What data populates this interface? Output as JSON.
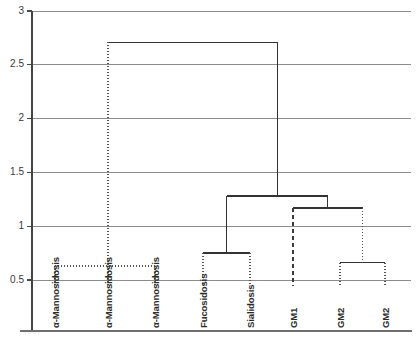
{
  "chart_data": {
    "type": "dendrogram",
    "title": "",
    "xlabel": "",
    "ylabel": "",
    "ylim": [
      0.35,
      3.0
    ],
    "grid": true,
    "legend": null,
    "y_ticks": [
      {
        "value": 3,
        "label": "3"
      },
      {
        "value": 2.5,
        "label": "2.5"
      },
      {
        "value": 2,
        "label": "2"
      },
      {
        "value": 1.5,
        "label": "1.5"
      },
      {
        "value": 1,
        "label": "1"
      },
      {
        "value": 0.5,
        "label": "0.5"
      }
    ],
    "leaves": [
      {
        "index": 0,
        "label": "α-Mannosidosis"
      },
      {
        "index": 1,
        "label": "α-Mannosidosis"
      },
      {
        "index": 2,
        "label": "α-Mannosidosis"
      },
      {
        "index": 3,
        "label": "Fucosidosis"
      },
      {
        "index": 4,
        "label": "Sialidosis"
      },
      {
        "index": 5,
        "label": "GM1"
      },
      {
        "index": 6,
        "label": "GM2"
      },
      {
        "index": 7,
        "label": "GM2"
      }
    ],
    "merges": [
      {
        "id": "m1",
        "name": "mannosidosis-trio",
        "children": [
          0,
          1,
          2
        ],
        "height": 0.63,
        "style": "dotted"
      },
      {
        "id": "m2",
        "name": "fucosidosis-sialidosis",
        "children": [
          3,
          4
        ],
        "height": 0.75,
        "style": "solid"
      },
      {
        "id": "m3",
        "name": "gm2-pair",
        "children": [
          6,
          7
        ],
        "height": 0.66,
        "style": "solid"
      },
      {
        "id": "m4",
        "name": "gm1-gm2-cluster",
        "children": [
          5,
          "m3"
        ],
        "height": 1.17,
        "style": "solid"
      },
      {
        "id": "m5",
        "name": "sialic-cluster",
        "children": [
          "m2",
          "m4"
        ],
        "height": 1.28,
        "style": "solid"
      },
      {
        "id": "m6",
        "name": "root",
        "children": [
          "m1",
          "m5"
        ],
        "height": 2.71,
        "style": "solid"
      }
    ]
  }
}
